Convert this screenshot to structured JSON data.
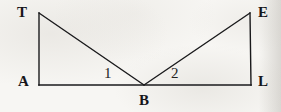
{
  "figure": {
    "background_color": "#f7f6f3",
    "stroke_color": "#1a1a1c",
    "stroke_width": 1.4,
    "canvas": {
      "width": 281,
      "height": 112
    },
    "points": {
      "T": {
        "x": 39,
        "y": 13
      },
      "E": {
        "x": 250,
        "y": 13
      },
      "A": {
        "x": 39,
        "y": 85
      },
      "L": {
        "x": 251,
        "y": 85
      },
      "B": {
        "x": 144,
        "y": 85
      }
    },
    "segments": [
      {
        "name": "TA",
        "from": "T",
        "to": "A"
      },
      {
        "name": "AL",
        "from": "A",
        "to": "L"
      },
      {
        "name": "LE",
        "from": "L",
        "to": "E"
      },
      {
        "name": "TB",
        "from": "T",
        "to": "B"
      },
      {
        "name": "BE",
        "from": "B",
        "to": "E"
      }
    ],
    "vertex_labels": [
      {
        "id": "T",
        "text": "T",
        "x": 17,
        "y": 5,
        "align": "left"
      },
      {
        "id": "E",
        "text": "E",
        "x": 258,
        "y": 5,
        "align": "left"
      },
      {
        "id": "A",
        "text": "A",
        "x": 18,
        "y": 74,
        "align": "left"
      },
      {
        "id": "L",
        "text": "L",
        "x": 258,
        "y": 74,
        "align": "left"
      },
      {
        "id": "B",
        "text": "B",
        "x": 139,
        "y": 93,
        "align": "left"
      }
    ],
    "angle_labels": [
      {
        "id": "1",
        "text": "1",
        "x": 104,
        "y": 66
      },
      {
        "id": "2",
        "text": "2",
        "x": 171,
        "y": 66
      }
    ]
  }
}
